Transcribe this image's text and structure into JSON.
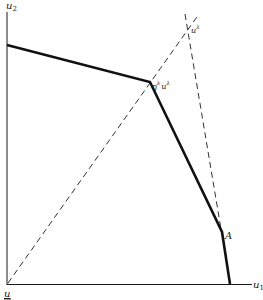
{
  "diagram": {
    "axes": {
      "y_label": "u",
      "y_label_sub": "2",
      "x_label": "u",
      "x_label_sub": "1",
      "origin_label": "u"
    },
    "points": {
      "u_lambda": {
        "base": "u",
        "sup": "λ"
      },
      "eta_u_lambda": {
        "eta": "η",
        "eta_sup": "λ",
        "base": "u",
        "sup": "λ"
      },
      "A": {
        "label": "A"
      }
    },
    "colors": {
      "ink": "#1a1a1a",
      "background": "#ffffff"
    }
  }
}
